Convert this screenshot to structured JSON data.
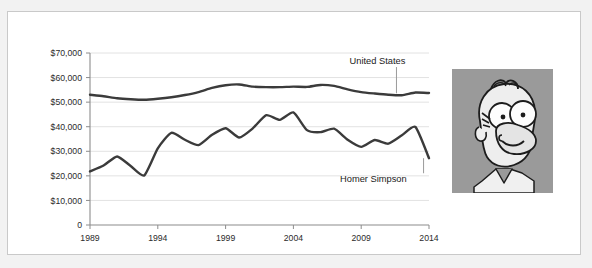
{
  "card": {
    "background": "#ffffff",
    "border_color": "#c9c9c9"
  },
  "page": {
    "background": "#f2f2f2"
  },
  "chart_data": {
    "type": "line",
    "title": "",
    "subtitle": "",
    "xlabel": "",
    "ylabel": "",
    "grid": true,
    "legend_position": "inline-annotation",
    "xlim": [
      1989,
      2014
    ],
    "ylim": [
      0,
      70000
    ],
    "yticks": [
      0,
      10000,
      20000,
      30000,
      40000,
      50000,
      60000,
      70000
    ],
    "ytick_labels": [
      "0",
      "$10,000",
      "$20,000",
      "$30,000",
      "$40,000",
      "$50,000",
      "$60,000",
      "$70,000"
    ],
    "xticks": [
      1989,
      1994,
      1999,
      2004,
      2009,
      2014
    ],
    "xtick_labels": [
      "1989",
      "1994",
      "1999",
      "2004",
      "2009",
      "2014"
    ],
    "x": [
      1989,
      1990,
      1991,
      1992,
      1993,
      1994,
      1995,
      1996,
      1997,
      1998,
      1999,
      2000,
      2001,
      2002,
      2003,
      2004,
      2005,
      2006,
      2007,
      2008,
      2009,
      2010,
      2011,
      2012,
      2013,
      2014
    ],
    "series": [
      {
        "name": "United States",
        "color": "#3b3b3b",
        "label_position": {
          "x": 2010.2,
          "y": 65500
        },
        "leader_to": {
          "x": 2011.6,
          "y": 53600
        },
        "values": [
          53000,
          52400,
          51600,
          51200,
          51000,
          51400,
          52000,
          52900,
          54100,
          55800,
          56900,
          57200,
          56300,
          56100,
          56100,
          56300,
          56200,
          57000,
          56600,
          55200,
          54100,
          53500,
          53000,
          52800,
          53900,
          53700
        ]
      },
      {
        "name": "Homer Simpson",
        "color": "#3b3b3b",
        "label_position": {
          "x": 2009.9,
          "y": 17400
        },
        "leader_to": {
          "x": 2013.6,
          "y": 27200
        },
        "values": [
          21800,
          24200,
          27900,
          24000,
          20200,
          31200,
          37500,
          34700,
          32500,
          36700,
          39400,
          35600,
          39300,
          44700,
          42800,
          45800,
          38600,
          37800,
          39200,
          34700,
          31800,
          34600,
          33100,
          36500,
          39900,
          27200
        ]
      }
    ]
  },
  "annotations": {
    "united_states_label": "United States",
    "homer_simpson_label": "Homer Simpson"
  },
  "photo": {
    "subject": "Homer Simpson cartoon portrait",
    "background_color": "#9a9a9a"
  }
}
